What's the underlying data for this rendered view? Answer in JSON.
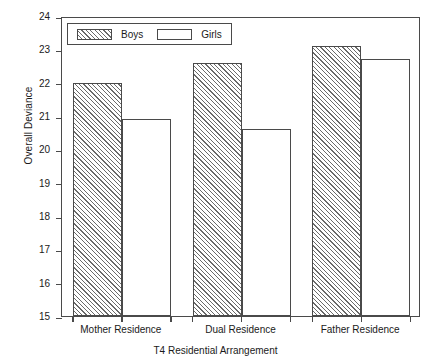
{
  "chart_data": {
    "type": "bar",
    "title": "",
    "xlabel": "T4 Residential Arrangement",
    "ylabel": "Overall Deviance",
    "categories": [
      "Mother Residence",
      "Dual Residence",
      "Father Residence"
    ],
    "series": [
      {
        "name": "Boys",
        "values": [
          22.0,
          22.6,
          23.1
        ],
        "fill": "hatched"
      },
      {
        "name": "Girls",
        "values": [
          20.9,
          20.6,
          22.7
        ],
        "fill": "empty"
      }
    ],
    "ylim": [
      15,
      24
    ],
    "yticks": [
      24,
      23,
      22,
      21,
      20,
      19,
      18,
      17,
      16,
      15
    ],
    "ytick_labels": [
      "24",
      "23",
      "22",
      "21",
      "20",
      "19",
      "18",
      "17",
      "16",
      "15"
    ],
    "grid": false,
    "legend_position": "top-left-inside",
    "axis_color": "#4a4a4a",
    "hatch_color": "#6a6a6a",
    "background": "#ffffff"
  },
  "legend": {
    "entries": [
      {
        "label": "Boys",
        "swatch": "hatched-swatch"
      },
      {
        "label": "Girls",
        "swatch": "empty-swatch"
      }
    ]
  }
}
